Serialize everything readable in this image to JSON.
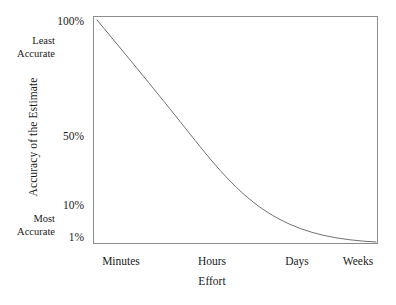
{
  "chart_data": {
    "type": "line",
    "title": "",
    "xlabel": "Effort",
    "ylabel": "Accuracy of the Estimate",
    "grid": false,
    "legend": "none",
    "x_tick_labels": [
      "Minutes",
      "Hours",
      "Days",
      "Weeks"
    ],
    "y_tick_labels": [
      "100%",
      "50%",
      "10%",
      "1%"
    ],
    "y_tick_values": [
      100,
      50,
      10,
      1
    ],
    "y_scale": "log-like",
    "ylim": [
      1,
      100
    ],
    "y_axis_annotations": [
      {
        "position": "top",
        "line1": "Least",
        "line2": "Accurate"
      },
      {
        "position": "bottom",
        "line1": "Most",
        "line2": "Accurate"
      }
    ],
    "series": [
      {
        "name": "Accuracy of the Estimate",
        "color": "#707070",
        "x": [
          "Minutes",
          "Hours",
          "Days",
          "Weeks"
        ],
        "points": [
          {
            "x": "Minutes",
            "y": 100
          },
          {
            "x": "Hours",
            "y": 43
          },
          {
            "x": "Days",
            "y": 7
          },
          {
            "x": "Weeks",
            "y": 1.6
          }
        ],
        "values": [
          100,
          43,
          7,
          1.6
        ]
      }
    ],
    "curve_path": "M 4,4 C 44,52 70,84 97,118 C 124,152 150,184 186,203 C 214,218 245,224 283,226"
  },
  "axes": {
    "y_ticks": [
      {
        "label": "100%"
      },
      {
        "label": "50%"
      },
      {
        "label": "10%"
      },
      {
        "label": "1%"
      }
    ],
    "x_ticks": [
      {
        "label": "Minutes"
      },
      {
        "label": "Hours"
      },
      {
        "label": "Days"
      },
      {
        "label": "Weeks"
      }
    ],
    "y_title": "Accuracy of the Estimate",
    "x_title": "Effort",
    "annotation_least_line1": "Least",
    "annotation_least_line2": "Accurate",
    "annotation_most_line1": "Most",
    "annotation_most_line2": "Accurate"
  },
  "colors": {
    "frame": "#8c8c8c",
    "curve": "#707070",
    "text": "#1a1a1a",
    "background": "#ffffff"
  }
}
